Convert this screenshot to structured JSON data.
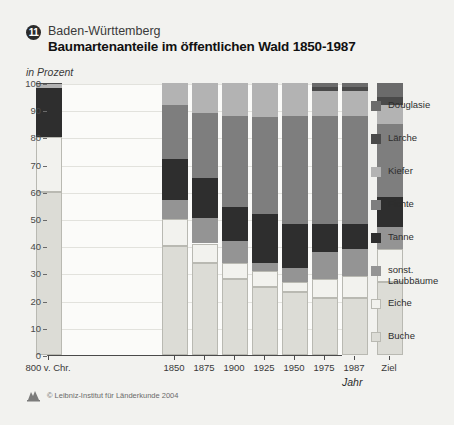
{
  "header": {
    "badge_number": "11",
    "region": "Baden-Württemberg",
    "title": "Baumartenanteile im öffentlichen Wald 1850-1987",
    "subtitle": "in Prozent"
  },
  "footer": {
    "copyright": "© Leibniz-Institut für Länderkunde 2004",
    "logo": "ifl-logo-icon"
  },
  "colors": {
    "douglasie": "#6b6b6b",
    "laerche": "#4a4a4a",
    "kiefer": "#b3b3b3",
    "fichte": "#7e7e7e",
    "tanne": "#2e2e2e",
    "sonst_laubbaeume": "#949494",
    "eiche": "#f2f2ee",
    "buche": "#dcdcd6",
    "panel_bg": "#fbfbf9",
    "page_bg": "#f2f2ef",
    "grid": "#e2e2dd",
    "axis": "#4a4a4a"
  },
  "chart_data": {
    "type": "bar",
    "stacked": true,
    "title": "Baumartenanteile im öffentlichen Wald 1850-1987",
    "subtitle": "in Prozent",
    "xlabel": "Jahr",
    "ylabel": "",
    "ylim": [
      0,
      100
    ],
    "yticks": [
      0,
      10,
      20,
      30,
      40,
      50,
      60,
      70,
      80,
      90,
      100
    ],
    "grid": true,
    "legend_position": "right",
    "categories": [
      "800 v. Chr.",
      "1850",
      "1875",
      "1900",
      "1925",
      "1950",
      "1975",
      "1987",
      "Ziel"
    ],
    "series": [
      {
        "name": "Buche",
        "key": "buche",
        "values": [
          60,
          40,
          34,
          28,
          25,
          23,
          21,
          21,
          27
        ]
      },
      {
        "name": "Eiche",
        "key": "eiche",
        "values": [
          20,
          10,
          7,
          6,
          6,
          4,
          7,
          8,
          12
        ]
      },
      {
        "name": "sonst. Laubbäume",
        "key": "sonst_laubbaeume",
        "values": [
          0,
          7,
          9.5,
          8,
          3,
          5,
          10,
          10,
          8
        ]
      },
      {
        "name": "Tanne",
        "key": "tanne",
        "values": [
          18,
          15,
          14.5,
          12.5,
          18,
          16,
          10,
          9,
          11
        ]
      },
      {
        "name": "Fichte",
        "key": "fichte",
        "values": [
          0,
          20,
          24,
          33.5,
          35.5,
          40,
          40,
          40,
          27
        ]
      },
      {
        "name": "Kiefer",
        "key": "kiefer",
        "values": [
          1.5,
          8,
          11,
          12,
          12.5,
          12,
          9,
          9,
          7
        ]
      },
      {
        "name": "Lärche",
        "key": "laerche",
        "values": [
          0.5,
          0,
          0,
          0,
          0,
          0,
          1.5,
          1.5,
          3
        ]
      },
      {
        "name": "Douglasie",
        "key": "douglasie",
        "values": [
          0,
          0,
          0,
          0,
          0,
          0,
          1.5,
          1.5,
          5
        ]
      }
    ]
  },
  "legend": {
    "items": [
      {
        "label": "Douglasie",
        "key": "douglasie"
      },
      {
        "label": "Lärche",
        "key": "laerche"
      },
      {
        "label": "Kiefer",
        "key": "kiefer"
      },
      {
        "label": "Fichte",
        "key": "fichte"
      },
      {
        "label": "Tanne",
        "key": "tanne"
      },
      {
        "label": "sonst.\nLaubbäume",
        "key": "sonst_laubbaeume"
      },
      {
        "label": "Eiche",
        "key": "eiche"
      },
      {
        "label": "Buche",
        "key": "buche"
      }
    ]
  }
}
